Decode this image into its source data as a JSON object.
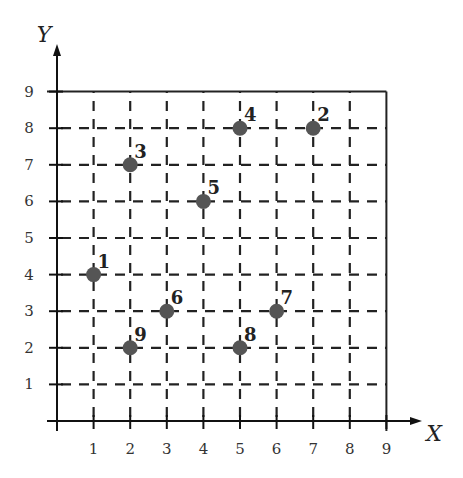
{
  "chart_data": {
    "type": "scatter",
    "title": "",
    "xlabel": "X",
    "ylabel": "Y",
    "xlim": [
      0,
      9
    ],
    "ylim": [
      0,
      9
    ],
    "x_ticks": [
      "1",
      "2",
      "3",
      "4",
      "5",
      "6",
      "7",
      "8",
      "9"
    ],
    "y_ticks": [
      "1",
      "2",
      "3",
      "4",
      "5",
      "6",
      "7",
      "8",
      "9"
    ],
    "grid": "dashed",
    "point_color": "#555555",
    "points": [
      {
        "label": "1",
        "x": 1,
        "y": 4
      },
      {
        "label": "2",
        "x": 7,
        "y": 8
      },
      {
        "label": "3",
        "x": 2,
        "y": 7
      },
      {
        "label": "4",
        "x": 5,
        "y": 8
      },
      {
        "label": "5",
        "x": 4,
        "y": 6
      },
      {
        "label": "6",
        "x": 3,
        "y": 3
      },
      {
        "label": "7",
        "x": 6,
        "y": 3
      },
      {
        "label": "8",
        "x": 5,
        "y": 2
      },
      {
        "label": "9",
        "x": 2,
        "y": 2
      }
    ]
  }
}
